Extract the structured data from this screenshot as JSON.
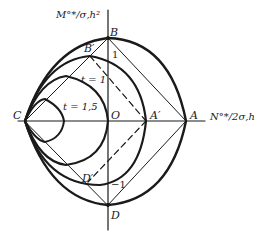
{
  "diagram": {
    "type": "interaction-yield-curves",
    "axes": {
      "vertical_label": "M°*/σ,h²",
      "horizontal_label": "N°*/2σ,h"
    },
    "points": {
      "B": "B",
      "B_prime": "B′",
      "C": "C",
      "O": "O",
      "A_prime": "A′",
      "A": "A",
      "D_prime": "D′",
      "D": "D"
    },
    "tick_labels": {
      "top": "1",
      "bottom": "−1"
    },
    "curve_labels": {
      "t1": "t = 1",
      "t15": "t = 1,5"
    },
    "colors": {
      "ink": "#1a1a1a",
      "background": "#ffffff"
    }
  }
}
